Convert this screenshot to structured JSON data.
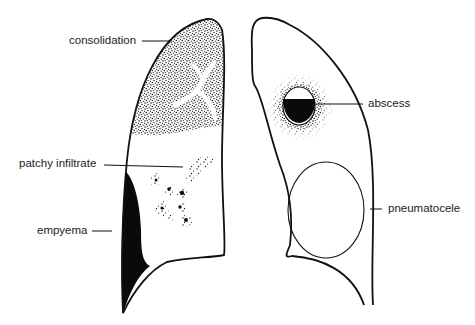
{
  "figure": {
    "labels": {
      "consolidation": "consolidation",
      "patchy_infiltrate": "patchy infiltrate",
      "empyema": "empyema",
      "abscess": "abscess",
      "pneumatocele": "pneumatocele"
    },
    "colors": {
      "line": "#111111",
      "fill_dark": "#0a0a0a",
      "background": "#ffffff"
    }
  }
}
